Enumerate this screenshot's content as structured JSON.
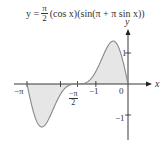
{
  "chart_data": {
    "type": "line",
    "equation": {
      "lhs": "y =",
      "frac_num": "π",
      "frac_den": "2",
      "rhs": "(cos x)(sin(π + π sin x))"
    },
    "xlabel": "x",
    "ylabel": "y",
    "xlim": [
      -3.4,
      0.45
    ],
    "ylim": [
      -1.35,
      1.5
    ],
    "x_ticks": [
      {
        "value": -3.14159,
        "label": "−π"
      },
      {
        "value": -1.5708,
        "label": "−π/2",
        "num": "−π",
        "den": "2"
      },
      {
        "value": -1,
        "label": "−1"
      },
      {
        "value": 0,
        "label": "0"
      }
    ],
    "y_ticks": [
      {
        "value": 1,
        "label": "1"
      },
      {
        "value": -1,
        "label": "−1"
      }
    ],
    "shaded_regions": [
      {
        "from": -3.14159,
        "to": -1.5708,
        "sign": "negative"
      },
      {
        "from": -1.5708,
        "to": 0,
        "sign": "positive"
      }
    ],
    "grid": false,
    "legend": null,
    "series": [
      {
        "name": "y = (π/2)cos x · sin(π + π sin x)",
        "x": [
          -3.1416,
          -2.9,
          -2.7,
          -2.5,
          -2.3,
          -2.1,
          -1.9,
          -1.7,
          -1.5708,
          -1.4,
          -1.2,
          -1.0,
          -0.8,
          -0.6,
          -0.5,
          -0.4,
          -0.2,
          0
        ],
        "y": [
          0,
          -0.77,
          -1.05,
          -0.95,
          -0.6,
          -0.25,
          -0.06,
          -0.005,
          0,
          0.02,
          0.19,
          0.52,
          0.92,
          1.19,
          1.2,
          1.1,
          0.6,
          0
        ]
      }
    ]
  }
}
